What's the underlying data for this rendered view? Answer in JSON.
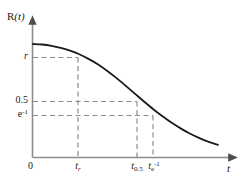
{
  "figure": {
    "axis_labels": {
      "y": "R(t)",
      "x": "t"
    },
    "origin_label": "0",
    "y_ticks": [
      {
        "label": "r",
        "value": 0.78
      },
      {
        "label": "0.5",
        "value": 0.5
      },
      {
        "label": "e",
        "exponent": "-1",
        "value": 0.3679
      }
    ],
    "x_ticks": [
      {
        "base": "t",
        "subscript": "r"
      },
      {
        "base": "t",
        "subscript": "0.5"
      },
      {
        "base": "t",
        "subscript": "e",
        "subscript_exponent": "-1"
      }
    ],
    "colors": {
      "curve": "#1a1a1a",
      "axis": "#808080",
      "dashed": "#808080",
      "text": "#1a1a1a",
      "background": "#ffffff"
    }
  },
  "chart_data": {
    "type": "line",
    "title": "",
    "xlabel": "t",
    "ylabel": "R(t)",
    "xlim": [
      0,
      1
    ],
    "ylim": [
      0,
      1
    ],
    "grid": false,
    "legend": null,
    "series": [
      {
        "name": "R(t)",
        "x": [
          0.0,
          0.05,
          0.1,
          0.15,
          0.2,
          0.25,
          0.3,
          0.35,
          0.4,
          0.45,
          0.5,
          0.55,
          0.6,
          0.65,
          0.7,
          0.75,
          0.8,
          0.85,
          0.9,
          0.95,
          1.0
        ],
        "y": [
          0.88,
          0.876,
          0.866,
          0.85,
          0.828,
          0.8,
          0.764,
          0.722,
          0.672,
          0.616,
          0.556,
          0.494,
          0.432,
          0.372,
          0.317,
          0.266,
          0.221,
          0.181,
          0.147,
          0.118,
          0.094
        ]
      }
    ],
    "annotations": [
      {
        "kind": "y-level",
        "label": "r",
        "y": 0.78,
        "dashed_to_curve": true,
        "paired_x_label": "t_r"
      },
      {
        "kind": "y-level",
        "label": "0.5",
        "y": 0.5,
        "dashed_to_curve": true,
        "paired_x_label": "t_0.5"
      },
      {
        "kind": "y-level",
        "label": "e^-1",
        "y": 0.3679,
        "dashed_to_curve": true,
        "paired_x_label": "t_e^-1"
      },
      {
        "kind": "x-marker",
        "label": "t_r",
        "x": 0.285
      },
      {
        "kind": "x-marker",
        "label": "t_0.5",
        "x": 0.575
      },
      {
        "kind": "x-marker",
        "label": "t_e^-1",
        "x": 0.655
      }
    ]
  }
}
